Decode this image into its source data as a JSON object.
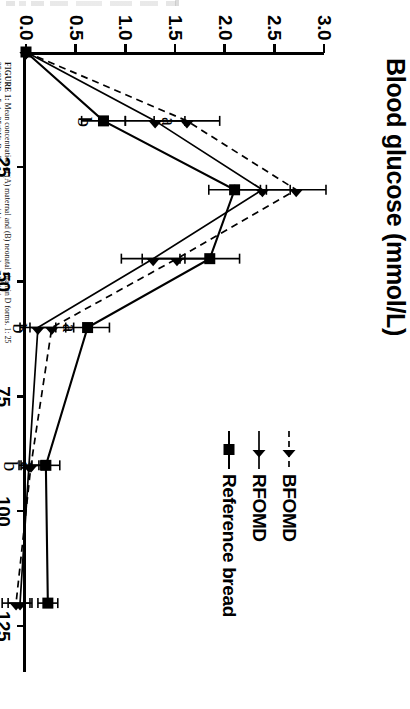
{
  "figure": {
    "caption_bold": "FIGURE 1:",
    "caption_rest": " Mean concentration of (A) maternal and (B) neonatal vitamin D forms. 1: 25",
    "caption_line2": "25(OH)D3, 5: 1α,25(OH)2D3. Bars represent within-group standard deviations.",
    "caption_full": "FIGURE 1: Mean concentration of (A) maternal and (B) neonatal vitamin D forms. 1: 25(OH)D3, 5: 1α,25(OH)2D3. Bars represent within-group standard deviations.",
    "caption_line2_prefix": "25(OH)D",
    "caption_line2_sub1": "3",
    "caption_line2_mid": ", 5: 1α,25(OH)",
    "caption_line2_sub2": "2",
    "caption_line2_mid2": "D",
    "caption_line2_sub3": "3",
    "caption_line2_tail": ", Bars represent within-group standard deviations."
  },
  "chart_data": {
    "type": "line",
    "title": "Blood glucose (mmol/L)",
    "xlabel": "",
    "ylabel": "Blood glucose (mmol/L)",
    "xlim": [
      0,
      135
    ],
    "ylim": [
      0.0,
      3.0
    ],
    "yticks": [
      "0.0",
      "0.5",
      "1.0",
      "1.5",
      "2.0",
      "2.5",
      "3.0"
    ],
    "ytick_values": [
      0.0,
      0.5,
      1.0,
      1.5,
      2.0,
      2.5,
      3.0
    ],
    "xticks": [
      "25",
      "50",
      "75",
      "100",
      "125"
    ],
    "xtick_values": [
      25,
      50,
      75,
      100,
      125
    ],
    "grid": false,
    "legend_position": "right",
    "x": [
      0,
      15,
      30,
      45,
      60,
      90,
      120
    ],
    "series": [
      {
        "name": "BFOMD",
        "marker": "triangle",
        "line": "dashed",
        "values": [
          0.0,
          1.62,
          2.72,
          1.52,
          0.26,
          0.05,
          -0.1
        ],
        "errors": [
          0.0,
          0.33,
          0.3,
          0.35,
          0.22,
          0.1,
          0.14
        ]
      },
      {
        "name": "RFOMD",
        "marker": "triangle",
        "line": "solid",
        "values": [
          0.0,
          1.3,
          2.38,
          1.28,
          0.12,
          0.03,
          -0.06
        ],
        "errors": [
          0.0,
          0.3,
          0.28,
          0.32,
          0.18,
          0.1,
          0.12
        ]
      },
      {
        "name": "Reference bread",
        "marker": "square",
        "line": "solid",
        "values": [
          0.0,
          0.78,
          2.1,
          1.85,
          0.62,
          0.2,
          0.22
        ],
        "errors": [
          0.0,
          0.22,
          0.26,
          0.3,
          0.22,
          0.14,
          0.1
        ]
      }
    ],
    "annotations": [
      {
        "label": "a",
        "x": 15,
        "y": 1.62
      },
      {
        "label": "b",
        "x": 15,
        "y": 0.78
      },
      {
        "label": "b",
        "x": 60,
        "y": 0.12
      },
      {
        "label": "a",
        "x": 60,
        "y": 0.62
      },
      {
        "label": "b",
        "x": 90,
        "y": 0.03
      },
      {
        "label": "a",
        "x": 90,
        "y": 0.2
      }
    ]
  },
  "legend": {
    "items": [
      {
        "label": "BFOMD",
        "marker": "triangle-icon",
        "line": "dashed"
      },
      {
        "label": "RFOMD",
        "marker": "triangle-icon",
        "line": "solid"
      },
      {
        "label": "Reference bread",
        "marker": "square-icon",
        "line": "solid"
      }
    ]
  }
}
